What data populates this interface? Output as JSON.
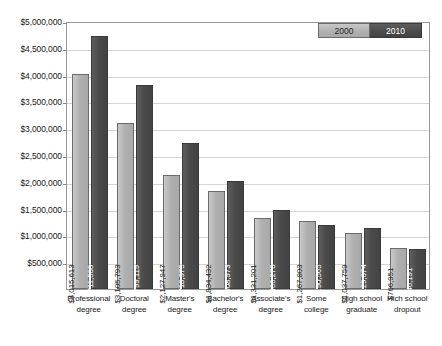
{
  "chart_data": {
    "type": "bar",
    "title": "",
    "xlabel": "",
    "ylabel": "",
    "ylim": [
      0,
      5000000
    ],
    "grid": true,
    "legend_position": "top-right",
    "y_ticks": [
      "$500,000",
      "$1,000,000",
      "$1,500,000",
      "$2,000,000",
      "$2,500,000",
      "$3,000,000",
      "$3,500,000",
      "$4,000,000",
      "$4,500,000",
      "$5,000,000"
    ],
    "y_tick_values": [
      500000,
      1000000,
      1500000,
      2000000,
      2500000,
      3000000,
      3500000,
      4000000,
      4500000,
      5000000
    ],
    "categories": [
      "Professional degree",
      "Doctoral degree",
      "Master's degree",
      "Bachelor's degree",
      "Associate's degree",
      "Some college",
      "High school graduate",
      "Hich school dropout"
    ],
    "category_lines": [
      [
        "Professional",
        "degree"
      ],
      [
        "Doctoral",
        "degree"
      ],
      [
        "Master's",
        "degree"
      ],
      [
        "Bachelor's",
        "degree"
      ],
      [
        "Associate's",
        "degree"
      ],
      [
        "Some",
        "college"
      ],
      [
        "High school",
        "graduate"
      ],
      [
        "Hich school",
        "dropout"
      ]
    ],
    "series": [
      {
        "name": "2000",
        "color": "#b0b0b0",
        "values": [
          4015613,
          3105793,
          2127947,
          1834432,
          1331201,
          1267803,
          1037759,
          766951
        ],
        "labels": [
          "$4,015,613",
          "$3,105,793",
          "$2,127,947",
          "$1,834,432",
          "$1,331,201",
          "$1,267,803",
          "$1,037,759",
          "$766,951"
        ]
      },
      {
        "name": "2010",
        "color": "#4a4a4a",
        "values": [
          4711500,
          3799119,
          2718375,
          2008973,
          1466270,
          1190565,
          1129074,
          746191
        ],
        "labels": [
          "$4,711,500",
          "$3,799,119",
          "$2,718,375",
          "$2,008,973",
          "$1,466,270",
          "$1,190,565",
          "$1,129,074",
          "$746,191"
        ]
      }
    ]
  },
  "legend": {
    "items": [
      {
        "label": "2000"
      },
      {
        "label": "2010"
      }
    ]
  }
}
